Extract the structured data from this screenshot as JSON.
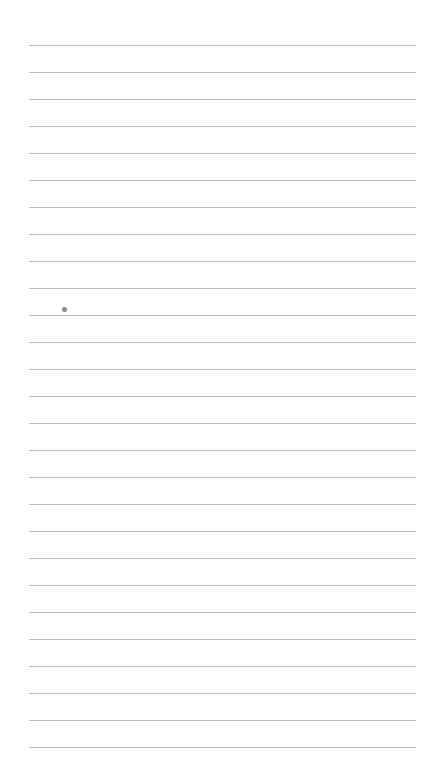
{
  "page": {
    "type": "lined-paper",
    "background_color": "#ffffff",
    "rule_color": "#b9b9b9",
    "rule_count": 27,
    "first_rule_y": 45,
    "rule_spacing": 27,
    "rule_left_x": 29,
    "rule_right_x": 416
  },
  "marks": [
    {
      "name": "speck",
      "x": 62,
      "y": 307,
      "color": "#8a8a8a"
    }
  ]
}
